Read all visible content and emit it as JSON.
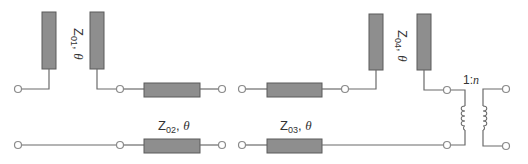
{
  "diagram": {
    "type": "transmission-line impedance transformer network",
    "labels": {
      "z01": {
        "main": "Z",
        "sub": "01",
        "suffix": ", ",
        "theta": "θ"
      },
      "z02": {
        "main": "Z",
        "sub": "02",
        "suffix": ", ",
        "theta": "θ"
      },
      "z03": {
        "main": "Z",
        "sub": "03",
        "suffix": ", ",
        "theta": "θ"
      },
      "z04": {
        "main": "Z",
        "sub": "04",
        "suffix": ", ",
        "theta": "θ"
      },
      "transformer_ratio": {
        "prefix": "1:",
        "n": "n"
      }
    },
    "components": [
      {
        "id": "stub-z01",
        "kind": "shunt stub pair",
        "label": "Z01, θ"
      },
      {
        "id": "series-z02",
        "kind": "series line (coupled pair)",
        "label": "Z02, θ"
      },
      {
        "id": "series-z03",
        "kind": "series line (coupled pair)",
        "label": "Z03, θ"
      },
      {
        "id": "stub-z04",
        "kind": "shunt stub pair",
        "label": "Z04, θ"
      },
      {
        "id": "transformer",
        "kind": "ideal transformer",
        "label": "1:n"
      }
    ],
    "colors": {
      "line_fill": "#8e8e8e",
      "wire": "#6b6b6b",
      "terminal": "#8a8a8a"
    }
  }
}
